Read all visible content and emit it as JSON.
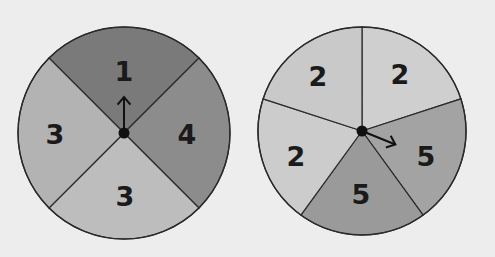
{
  "spinners": [
    {
      "name": "left-spinner",
      "cx": 124,
      "cy": 133,
      "r": 106,
      "sectors": [
        {
          "label": "1",
          "start": -135,
          "end": -45,
          "color": "#7a7a7a",
          "lx": 124,
          "ly": 71
        },
        {
          "label": "4",
          "start": -45,
          "end": 45,
          "color": "#8c8c8c",
          "lx": 187,
          "ly": 134
        },
        {
          "label": "3",
          "start": 45,
          "end": 135,
          "color": "#bdbdbd",
          "lx": 125,
          "ly": 196
        },
        {
          "label": "3",
          "start": 135,
          "end": 225,
          "color": "#b3b3b3",
          "lx": 55,
          "ly": 134
        }
      ],
      "pointer_angle": -90
    },
    {
      "name": "right-spinner",
      "cx": 362,
      "cy": 131,
      "r": 104,
      "sectors": [
        {
          "label": "2",
          "start": -90,
          "end": -18,
          "color": "#cfcfcf",
          "lx": 400,
          "ly": 74
        },
        {
          "label": "5",
          "start": -18,
          "end": 54,
          "color": "#a3a3a3",
          "lx": 426,
          "ly": 156
        },
        {
          "label": "5",
          "start": 54,
          "end": 126,
          "color": "#9a9a9a",
          "lx": 361,
          "ly": 194
        },
        {
          "label": "2",
          "start": 126,
          "end": 198,
          "color": "#cccccc",
          "lx": 296,
          "ly": 156
        },
        {
          "label": "2",
          "start": 198,
          "end": 270,
          "color": "#c9c9c9",
          "lx": 318,
          "ly": 76
        }
      ],
      "pointer_angle": 22
    }
  ]
}
